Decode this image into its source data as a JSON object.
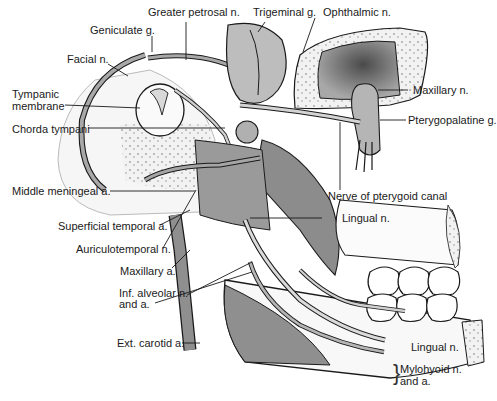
{
  "diagram": {
    "style": "grayscale anatomical line drawing"
  },
  "labels": {
    "greater_petrosal": "Greater petrosal n.",
    "geniculate": "Geniculate g.",
    "trigeminal": "Trigeminal g.",
    "ophthalmic": "Ophthalmic n.",
    "facial": "Facial n.",
    "tympanic_1": "Tympanic",
    "tympanic_2": "membrane",
    "chorda_tympani": "Chorda tympani",
    "maxillary_n": "Maxillary n.",
    "pterygopalatine": "Pterygopalatine g.",
    "middle_meningeal": "Middle meningeal a.",
    "nerve_pterygoid": "Nerve of pterygoid canal",
    "superficial_temporal": "Superficial temporal a.",
    "lingual_upper": "Lingual n.",
    "auriculotemporal": "Auriculotemporal n.",
    "maxillary_a": "Maxillary a.",
    "inf_alveolar_1": "Inf. alveolar n.",
    "inf_alveolar_2": "and a.",
    "ext_carotid": "Ext. carotid a.",
    "lingual_lower": "Lingual n.",
    "mylohyoid_1": "Mylohyoid n.",
    "mylohyoid_2": "and a."
  },
  "colors": {
    "line": "#1a1a1a",
    "nerve_fill": "#9a9a9a",
    "muscle_fill": "#8c8c8c",
    "bone_fill": "#ececec",
    "cavity_fill": "#6e6e6e",
    "soft_fill": "#c8c8c8"
  }
}
